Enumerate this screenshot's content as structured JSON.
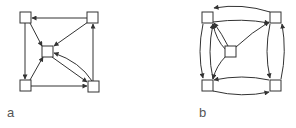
{
  "colors": {
    "stroke": "#333333",
    "label": "#555555",
    "background": "#ffffff"
  },
  "panels": [
    {
      "id": "a",
      "label": "a",
      "nodes": [
        "top-left",
        "top-right",
        "center",
        "bottom-left",
        "bottom-right"
      ],
      "edges": [
        {
          "from": "top-right",
          "to": "top-left"
        },
        {
          "from": "top-left",
          "to": "bottom-left"
        },
        {
          "from": "top-left",
          "to": "center"
        },
        {
          "from": "top-right",
          "to": "center"
        },
        {
          "from": "bottom-left",
          "to": "center"
        },
        {
          "from": "bottom-left",
          "to": "bottom-right"
        },
        {
          "from": "center",
          "to": "bottom-right"
        },
        {
          "from": "bottom-right",
          "to": "center"
        },
        {
          "from": "bottom-right",
          "to": "top-right"
        }
      ]
    },
    {
      "id": "b",
      "label": "b",
      "nodes": [
        "top-left",
        "top-right",
        "center",
        "bottom-left",
        "bottom-right"
      ],
      "edges": [
        {
          "from": "top-right",
          "to": "top-left",
          "curved": true
        },
        {
          "from": "top-left",
          "to": "top-right",
          "curved": true
        },
        {
          "from": "top-left",
          "to": "bottom-left",
          "curved": true
        },
        {
          "from": "bottom-left",
          "to": "top-left",
          "curved": true
        },
        {
          "from": "top-right",
          "to": "bottom-right",
          "curved": true
        },
        {
          "from": "bottom-right",
          "to": "top-right",
          "curved": true
        },
        {
          "from": "bottom-right",
          "to": "bottom-left",
          "curved": true
        },
        {
          "from": "bottom-left",
          "to": "bottom-right",
          "curved": true
        },
        {
          "from": "center",
          "to": "top-left"
        },
        {
          "from": "center",
          "to": "top-right"
        },
        {
          "from": "center",
          "to": "bottom-left"
        },
        {
          "from": "bottom-left",
          "to": "top-left"
        },
        {
          "from": "top-left",
          "to": "top-right"
        }
      ]
    }
  ]
}
